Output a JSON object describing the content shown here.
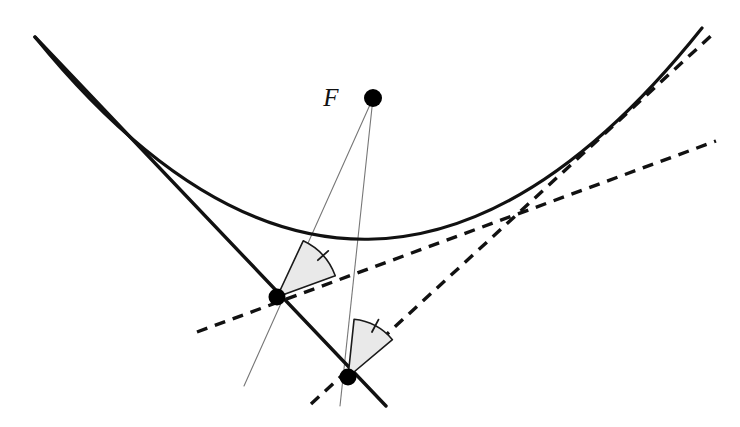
{
  "figure": {
    "background_color": "#ffffff",
    "width": 740,
    "height": 427,
    "labels": {
      "focus": "F"
    },
    "colors": {
      "curve": "#111111",
      "solid_line": "#111111",
      "dashed_line": "#111111",
      "thin_ray": "#777777",
      "sector_fill": "#e9e9e9",
      "sector_stroke": "#1a1a1a",
      "point_fill": "#000000",
      "label_color": "#111111"
    },
    "stroke_widths": {
      "curve": 3.2,
      "solid_line": 3.4,
      "dashed_line": 3.4,
      "thin_ray": 1.1,
      "sector": 1.6,
      "tick": 1.8
    },
    "dash_pattern": "11 8",
    "points": {
      "focus": {
        "x": 373,
        "y": 98,
        "r": 9,
        "label": "F"
      },
      "upper_tangency": {
        "x": 277,
        "y": 297,
        "r": 8.5
      },
      "lower_tangency": {
        "x": 348,
        "y": 377,
        "r": 8.5
      }
    },
    "label_positions": {
      "focus_label": {
        "x": 331,
        "y": 106
      }
    },
    "parabola": {
      "vertex": {
        "x": 346,
        "y": 238
      },
      "x_start": 35,
      "x_end": 702,
      "control": {
        "x": 368,
        "y": 446
      },
      "path": "M 35 37 Q 368 446 702 28"
    },
    "solid_chord": {
      "from": {
        "x": 35,
        "y": 37
      },
      "to": {
        "x": 386,
        "y": 406
      },
      "comment": "thick straight line through both tangency points"
    },
    "dashed_tangent_upper": {
      "from": {
        "x": 197,
        "y": 332
      },
      "to": {
        "x": 716,
        "y": 141
      }
    },
    "dashed_tangent_lower": {
      "from": {
        "x": 311,
        "y": 404
      },
      "to": {
        "x": 713,
        "y": 34
      }
    },
    "thin_ray_upper": {
      "from": {
        "x": 373,
        "y": 98
      },
      "to": {
        "x": 244,
        "y": 386
      },
      "comment": "focal ray through upper tangency point"
    },
    "thin_ray_lower": {
      "from": {
        "x": 373,
        "y": 98
      },
      "to": {
        "x": 340,
        "y": 406
      },
      "comment": "focal ray through lower tangency point"
    },
    "sector_upper": {
      "center": {
        "x": 277,
        "y": 297
      },
      "radius": 62,
      "start_angle_deg": -65,
      "end_angle_deg": -20,
      "tick_angle_deg": -42
    },
    "sector_lower": {
      "center": {
        "x": 348,
        "y": 377
      },
      "radius": 58,
      "start_angle_deg": -84,
      "end_angle_deg": -40,
      "tick_angle_deg": -62
    }
  }
}
